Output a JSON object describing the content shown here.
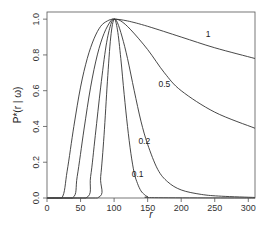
{
  "chart_data": {
    "type": "line",
    "title": "",
    "xlabel": "r",
    "ylabel": "P*(r | ω)",
    "xlim": [
      0,
      310
    ],
    "ylim": [
      0,
      1.04
    ],
    "grid": false,
    "legend": "none (inline curve labels)",
    "x_ticks": [
      0,
      50,
      100,
      150,
      200,
      250,
      300
    ],
    "y_ticks": [
      0.0,
      0.2,
      0.4,
      0.6,
      0.8,
      1.0
    ],
    "x_tick_labels": [
      "0",
      "50",
      "100",
      "150",
      "200",
      "250",
      "300"
    ],
    "y_tick_labels": [
      "0.0",
      "0.2",
      "0.4",
      "0.6",
      "0.8",
      "1.0"
    ],
    "series": [
      {
        "name": "1",
        "label_pos": [
          240,
          0.9
        ],
        "x": [
          0,
          22,
          30,
          40,
          50,
          60,
          70,
          80,
          90,
          100,
          120,
          150,
          200,
          250,
          310
        ],
        "y": [
          0,
          0,
          0.15,
          0.4,
          0.62,
          0.78,
          0.89,
          0.96,
          0.99,
          1.0,
          0.99,
          0.96,
          0.9,
          0.84,
          0.78
        ]
      },
      {
        "name": "0.5",
        "label_pos": [
          175,
          0.62
        ],
        "x": [
          0,
          38,
          45,
          55,
          65,
          75,
          85,
          95,
          100,
          110,
          125,
          150,
          175,
          200,
          250,
          310
        ],
        "y": [
          0,
          0,
          0.12,
          0.38,
          0.62,
          0.8,
          0.92,
          0.99,
          1.0,
          0.99,
          0.94,
          0.83,
          0.7,
          0.6,
          0.48,
          0.39
        ]
      },
      {
        "name": "0.2",
        "label_pos": [
          145,
          0.3
        ],
        "x": [
          0,
          58,
          65,
          72,
          80,
          88,
          95,
          100,
          105,
          112,
          120,
          130,
          140,
          150,
          165,
          180,
          200,
          230,
          260,
          310
        ],
        "y": [
          0,
          0,
          0.12,
          0.35,
          0.62,
          0.85,
          0.97,
          1.0,
          0.98,
          0.9,
          0.78,
          0.6,
          0.43,
          0.3,
          0.16,
          0.09,
          0.045,
          0.02,
          0.01,
          0.003
        ]
      },
      {
        "name": "0.1",
        "label_pos": [
          135,
          0.12
        ],
        "x": [
          0,
          75,
          80,
          85,
          90,
          95,
          100,
          105,
          110,
          115,
          120,
          125,
          130,
          135,
          140,
          145,
          150,
          160,
          310
        ],
        "y": [
          0,
          0,
          0.12,
          0.35,
          0.65,
          0.9,
          1.0,
          0.94,
          0.78,
          0.58,
          0.4,
          0.25,
          0.14,
          0.08,
          0.04,
          0.02,
          0.008,
          0.002,
          0
        ]
      }
    ]
  }
}
